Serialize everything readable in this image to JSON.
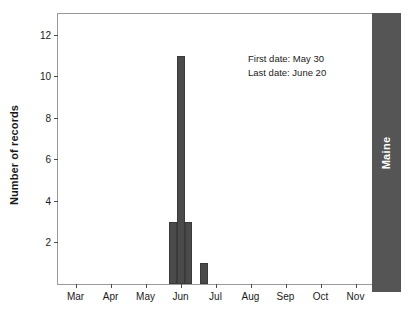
{
  "chart_data": {
    "type": "bar",
    "title": "",
    "subtitle": "",
    "xlabel": "",
    "ylabel": "Number of records",
    "ylim": [
      0,
      13
    ],
    "grid": false,
    "legend": null,
    "bar_color": "#4a4a4a",
    "background_color": "#ffffff",
    "frame_color": "#9a9a9a",
    "x_tick_labels": [
      "Mar",
      "Apr",
      "May",
      "Jun",
      "Jul",
      "Aug",
      "Sep",
      "Oct",
      "Nov"
    ],
    "x_tick_positions": [
      0.5,
      1.5,
      2.5,
      3.5,
      4.5,
      5.5,
      6.5,
      7.5,
      8.5
    ],
    "y_tick_labels": [
      "2",
      "4",
      "6",
      "8",
      "10",
      "12"
    ],
    "y_tick_values": [
      2,
      4,
      6,
      8,
      10,
      12
    ],
    "categories": [
      "bin-1",
      "bin-2",
      "bin-3",
      "bin-4"
    ],
    "values": [
      3,
      11,
      3,
      1
    ],
    "bars": [
      {
        "label": "bin-1",
        "value": 3,
        "x_start": 3.18,
        "x_end": 3.4
      },
      {
        "label": "bin-2",
        "value": 11,
        "x_start": 3.4,
        "x_end": 3.62
      },
      {
        "label": "bin-3",
        "value": 3,
        "x_start": 3.62,
        "x_end": 3.84
      },
      {
        "label": "bin-4",
        "value": 1,
        "x_start": 4.07,
        "x_end": 4.29
      }
    ],
    "annotations": [
      "First date: May 30",
      "Last date: June 20"
    ],
    "region_label": "Maine",
    "region_label_color": "#ffffff",
    "region_strip_color": "#555555"
  }
}
